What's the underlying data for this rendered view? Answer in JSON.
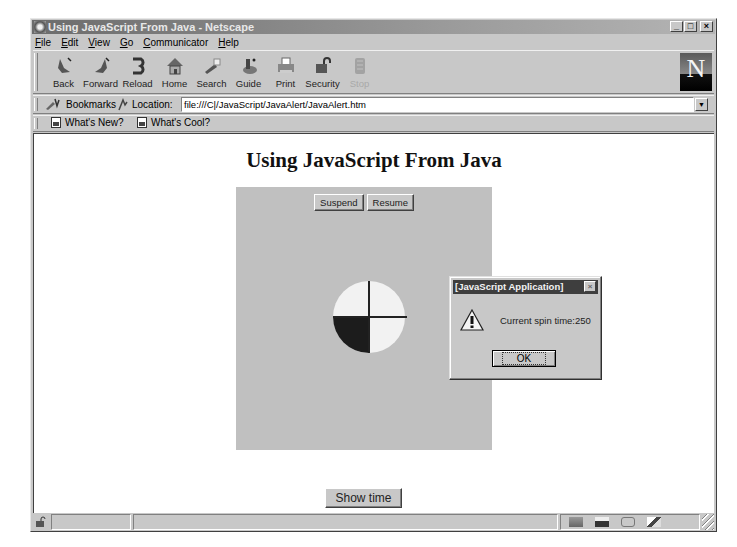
{
  "window": {
    "title": "Using JavaScript From Java - Netscape",
    "controls": {
      "minimize": "_",
      "maximize": "□",
      "close": "×"
    }
  },
  "menu": [
    "File",
    "Edit",
    "View",
    "Go",
    "Communicator",
    "Help"
  ],
  "nav_toolbar": {
    "buttons": [
      {
        "label": "Back",
        "icon": "back-arrow-icon",
        "enabled": true
      },
      {
        "label": "Forward",
        "icon": "forward-arrow-icon",
        "enabled": true
      },
      {
        "label": "Reload",
        "icon": "reload-icon",
        "enabled": true
      },
      {
        "label": "Home",
        "icon": "home-icon",
        "enabled": true
      },
      {
        "label": "Search",
        "icon": "search-flashlight-icon",
        "enabled": true
      },
      {
        "label": "Guide",
        "icon": "guide-icon",
        "enabled": true
      },
      {
        "label": "Print",
        "icon": "printer-icon",
        "enabled": true
      },
      {
        "label": "Security",
        "icon": "padlock-icon",
        "enabled": true
      },
      {
        "label": "Stop",
        "icon": "stop-icon",
        "enabled": false
      }
    ],
    "logo": "N"
  },
  "location_toolbar": {
    "bookmarks_label": "Bookmarks",
    "location_label": "Location:",
    "url": "file:///C|/JavaScript/JavaAlert/JavaAlert.htm"
  },
  "personal_toolbar": {
    "items": [
      "What's New?",
      "What's Cool?"
    ]
  },
  "page": {
    "heading": "Using JavaScript From Java",
    "applet": {
      "buttons": [
        "Suspend",
        "Resume"
      ],
      "spinner": {
        "quadrant_colors": [
          "#f2f2f2",
          "#f2f2f2",
          "#f2f2f2",
          "#1c1c1c"
        ],
        "background": "#c0c0c0"
      }
    },
    "show_time_button": "Show time"
  },
  "alert_dialog": {
    "title": "[JavaScript Application]",
    "message": "Current spin time:250",
    "ok_label": "OK",
    "close": "×"
  },
  "status_bar": {
    "message": ""
  }
}
